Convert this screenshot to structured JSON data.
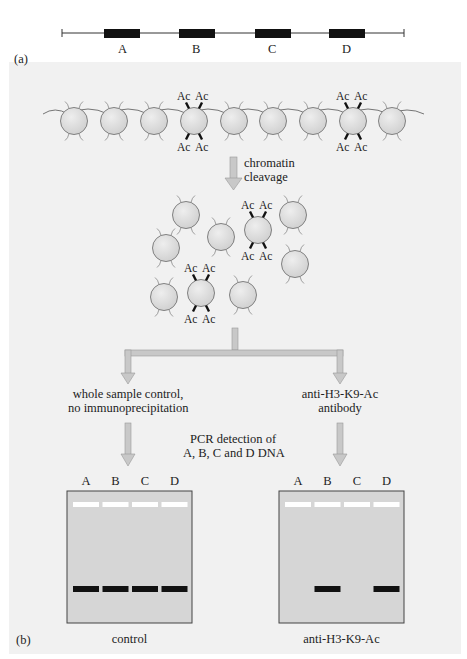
{
  "panel_a": {
    "label": "(a)",
    "genes": [
      "A",
      "B",
      "C",
      "D"
    ]
  },
  "panel_b": {
    "label": "(b)",
    "ac_label": "Ac",
    "step1": {
      "line1": "chromatin",
      "line2": "cleavage"
    },
    "branch_left": {
      "line1": "whole sample control,",
      "line2": "no immunoprecipitation"
    },
    "branch_right": {
      "line1": "anti-H3-K9-Ac",
      "line2": "antibody"
    },
    "pcr": {
      "line1": "PCR detection of",
      "line2": "A, B, C and D DNA"
    },
    "gels": [
      {
        "name": "control",
        "caption": "control",
        "lanes": [
          "A",
          "B",
          "C",
          "D"
        ],
        "band_present": [
          true,
          true,
          true,
          true
        ]
      },
      {
        "name": "anti-H3-K9-Ac",
        "caption": "anti-H3-K9-Ac",
        "lanes": [
          "A",
          "B",
          "C",
          "D"
        ],
        "band_present": [
          false,
          true,
          false,
          true
        ]
      }
    ]
  },
  "colors": {
    "panel_bg": "#f1f1f1",
    "nucleosome_fill": "#d9d9d9",
    "arrow_fill": "#c8c8c8",
    "gel_bg": "#d6d6d6",
    "band": "#111111",
    "well": "#ffffff"
  }
}
